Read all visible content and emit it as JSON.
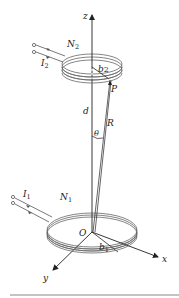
{
  "diagram": {
    "type": "coaxial coil geometry",
    "axes": {
      "z": "z",
      "x": "x",
      "y": "y",
      "origin": "O"
    },
    "upper_coil": {
      "turns_label": "N",
      "turns_sub": "2",
      "current_label": "I",
      "current_sub": "2",
      "radius_label": "b",
      "radius_sub": "2"
    },
    "lower_coil": {
      "turns_label": "N",
      "turns_sub": "1",
      "current_label": "I",
      "current_sub": "1",
      "radius_label": "b",
      "radius_sub": "1"
    },
    "point_label": "P",
    "distance_label": "d",
    "vector_label": "R",
    "angle_label": "θ"
  },
  "colors": {
    "line": "#222222",
    "coil": "#555555",
    "rule": "#888888"
  }
}
